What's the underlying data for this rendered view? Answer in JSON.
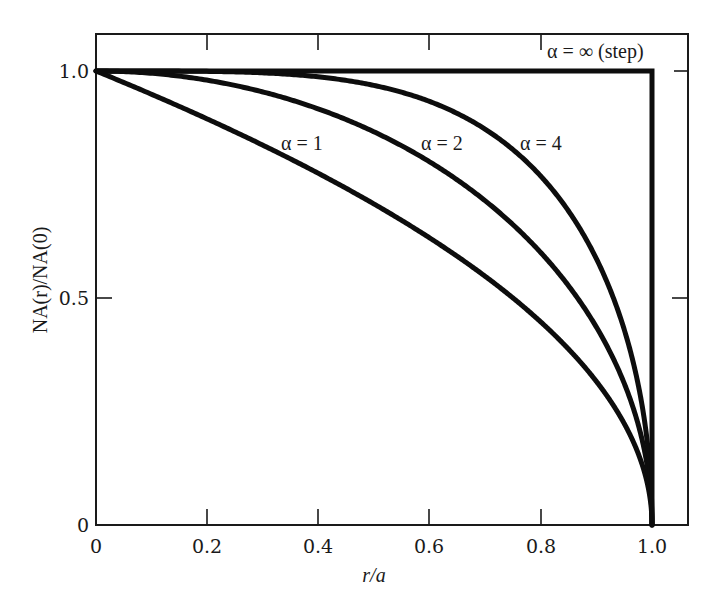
{
  "chart_data": {
    "type": "line",
    "title": "",
    "xlabel": "r/a",
    "ylabel": "NA(r)/NA(0)",
    "xlim": [
      0,
      1.07
    ],
    "ylim": [
      0,
      1.08
    ],
    "grid": false,
    "legend": "inline labels",
    "x_ticks": [
      "0",
      "0.2",
      "0.4",
      "0.6",
      "0.8",
      "1.0"
    ],
    "y_ticks": [
      "0",
      "0.5",
      "1.0"
    ],
    "x": [
      0,
      0.1,
      0.2,
      0.3,
      0.4,
      0.5,
      0.6,
      0.7,
      0.8,
      0.9,
      0.95,
      1.0
    ],
    "series": [
      {
        "name": "α = 1",
        "values": [
          1.0,
          0.949,
          0.894,
          0.837,
          0.775,
          0.707,
          0.632,
          0.548,
          0.447,
          0.316,
          0.224,
          0.0
        ]
      },
      {
        "name": "α = 2",
        "values": [
          1.0,
          0.995,
          0.98,
          0.954,
          0.917,
          0.866,
          0.8,
          0.714,
          0.6,
          0.436,
          0.312,
          0.0
        ]
      },
      {
        "name": "α = 4",
        "values": [
          1.0,
          1.0,
          0.999,
          0.996,
          0.987,
          0.968,
          0.933,
          0.87,
          0.769,
          0.585,
          0.432,
          0.0
        ]
      },
      {
        "name": "α = ∞ (step)",
        "values": [
          1.0,
          1.0,
          1.0,
          1.0,
          1.0,
          1.0,
          1.0,
          1.0,
          1.0,
          1.0,
          1.0,
          0.0
        ]
      }
    ],
    "annotations": [
      "α = 1",
      "α = 2",
      "α = 4",
      "α = ∞ (step)"
    ]
  },
  "labels": {
    "xlabel": "r/a",
    "ylabel": "NA(r)/NA(0)",
    "x_ticks": [
      "0",
      "0.2",
      "0.4",
      "0.6",
      "0.8",
      "1.0"
    ],
    "y_ticks": [
      "0",
      "0.5",
      "1.0"
    ],
    "curves": {
      "a1": "α = 1",
      "a2": "α = 2",
      "a4": "α = 4",
      "ainf": "α = ∞ (step)"
    }
  },
  "colors": {
    "line": "#0d0d0d",
    "frame": "#1a1a1a",
    "background": "#ffffff"
  }
}
